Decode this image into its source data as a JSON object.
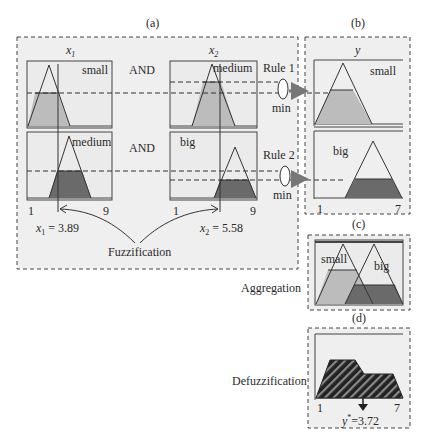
{
  "panels": {
    "a": {
      "label": "(a)"
    },
    "b": {
      "label": "(b)"
    },
    "c": {
      "label": "(c)"
    },
    "d": {
      "label": "(d)"
    }
  },
  "inputs": {
    "x1": {
      "name": "x",
      "sub": "1",
      "mf_top": "small",
      "mf_bottom": "medium",
      "range_min": "1",
      "range_max": "9",
      "value_text": " = 3.89"
    },
    "x2": {
      "name": "x",
      "sub": "2",
      "mf_top": "medium",
      "mf_bottom": "big",
      "range_min": "1",
      "range_max": "9",
      "value_text": " = 5.58"
    }
  },
  "operators": {
    "and_1": "AND",
    "and_2": "AND"
  },
  "rules": [
    {
      "label": "Rule 1",
      "op": "min"
    },
    {
      "label": "Rule 2",
      "op": "min"
    }
  ],
  "output": {
    "name": "y",
    "mf_top": "small",
    "mf_bottom": "big",
    "range_min": "1",
    "range_max": "7"
  },
  "aggregation": {
    "label": "Aggregation",
    "mf_left": "small",
    "mf_right": "big"
  },
  "defuzzification": {
    "label": "Defuzzification",
    "range_min": "1",
    "range_max": "7",
    "result_name": "y",
    "result_sup": "*",
    "result_text": "=3.72"
  },
  "fuzzification": {
    "label": "Fuzzification"
  },
  "colors": {
    "panel_bg": "#efefef",
    "box_bg": "#ebebeb",
    "light_fill": "#bcbcbc",
    "dark_fill": "#6a6a6a",
    "line": "#333333",
    "arrow": "#777777"
  }
}
